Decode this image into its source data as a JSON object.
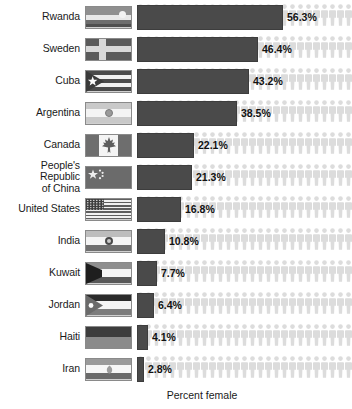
{
  "chart_data": {
    "type": "bar",
    "title": "",
    "xlabel": "Percent female",
    "ylabel": "",
    "orientation": "horizontal",
    "grid": false,
    "legend": false,
    "xlim": [
      0,
      60
    ],
    "categories": [
      "Rwanda",
      "Sweden",
      "Cuba",
      "Argentina",
      "Canada",
      "People's Republic\nof China",
      "United States",
      "India",
      "Kuwait",
      "Jordan",
      "Haiti",
      "Iran"
    ],
    "values": [
      56.3,
      46.4,
      43.2,
      38.5,
      22.1,
      21.3,
      16.8,
      10.8,
      7.7,
      6.4,
      4.1,
      2.8
    ],
    "value_labels": [
      "56.3%",
      "46.4%",
      "43.2%",
      "38.5%",
      "22.1%",
      "21.3%",
      "16.8%",
      "10.8%",
      "7.7%",
      "6.4%",
      "4.1%",
      "2.8%"
    ],
    "colors": {
      "bar": "#4a4a4a",
      "bar_border": "#3d3d3d",
      "person_icon": "#dcdcdc",
      "text": "#1a1a1a",
      "background": "#ffffff"
    }
  },
  "axis": {
    "x_title": "Percent female"
  },
  "rows": [
    {
      "country": "Rwanda",
      "flag": "rwanda-flag",
      "value": 56.3,
      "value_label": "56.3%"
    },
    {
      "country": "Sweden",
      "flag": "sweden-flag",
      "value": 46.4,
      "value_label": "46.4%"
    },
    {
      "country": "Cuba",
      "flag": "cuba-flag",
      "value": 43.2,
      "value_label": "43.2%"
    },
    {
      "country": "Argentina",
      "flag": "argentina-flag",
      "value": 38.5,
      "value_label": "38.5%"
    },
    {
      "country": "Canada",
      "flag": "canada-flag",
      "value": 22.1,
      "value_label": "22.1%"
    },
    {
      "country": "People's Republic\nof China",
      "flag": "china-flag",
      "value": 21.3,
      "value_label": "21.3%"
    },
    {
      "country": "United States",
      "flag": "united-states-flag",
      "value": 16.8,
      "value_label": "16.8%"
    },
    {
      "country": "India",
      "flag": "india-flag",
      "value": 10.8,
      "value_label": "10.8%"
    },
    {
      "country": "Kuwait",
      "flag": "kuwait-flag",
      "value": 7.7,
      "value_label": "7.7%"
    },
    {
      "country": "Jordan",
      "flag": "jordan-flag",
      "value": 6.4,
      "value_label": "6.4%"
    },
    {
      "country": "Haiti",
      "flag": "haiti-flag",
      "value": 4.1,
      "value_label": "4.1%"
    },
    {
      "country": "Iran",
      "flag": "iran-flag",
      "value": 2.8,
      "value_label": "2.8%"
    }
  ]
}
